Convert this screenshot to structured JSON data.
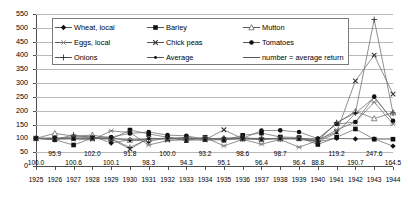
{
  "chart_data": {
    "type": "line",
    "title": "",
    "xlabel": "",
    "ylabel": "",
    "ylim": [
      0,
      550
    ],
    "ytick_step": 50,
    "grid": "horizontal",
    "legend_position": "top-inside",
    "categories": [
      "1925",
      "1926",
      "1927",
      "1928",
      "1929",
      "1930",
      "1931",
      "1932",
      "1933",
      "1934",
      "1935",
      "1936",
      "1937",
      "1938",
      "1939",
      "1940",
      "1941",
      "1942",
      "1943",
      "1944"
    ],
    "yticks": [
      "0",
      "50",
      "100",
      "150",
      "200",
      "250",
      "300",
      "350",
      "400",
      "450",
      "500",
      "550"
    ],
    "series": [
      {
        "name": "Wheat, local",
        "marker": "filled-diamond",
        "values": [
          100,
          100,
          105,
          108,
          83,
          95,
          89,
          103,
          99,
          97,
          101,
          103,
          97,
          101,
          99,
          88,
          100,
          98,
          98,
          72
        ]
      },
      {
        "name": "Barley",
        "marker": "filled-square",
        "values": [
          100,
          95,
          76,
          101,
          97,
          130,
          116,
          104,
          92,
          104,
          93,
          111,
          119,
          105,
          103,
          78,
          104,
          134,
          97,
          97
        ]
      },
      {
        "name": "Mutton",
        "marker": "open-triangle",
        "values": [
          100,
          118,
          108,
          112,
          101,
          94,
          97,
          98,
          101,
          99,
          100,
          100,
          100,
          99,
          100,
          97,
          155,
          198,
          172,
          193
        ]
      },
      {
        "name": "Eggs, local",
        "marker": "star",
        "values": [
          100,
          99,
          97,
          95,
          127,
          121,
          76,
          92,
          95,
          103,
          73,
          96,
          79,
          96,
          68,
          92,
          131,
          159,
          231,
          152
        ]
      },
      {
        "name": "Chick peas",
        "marker": "cross-x",
        "values": [
          100,
          98,
          101,
          99,
          98,
          61,
          101,
          97,
          103,
          95,
          131,
          99,
          95,
          101,
          99,
          95,
          123,
          308,
          401,
          260
        ]
      },
      {
        "name": "Tomatoes",
        "marker": "filled-circle",
        "values": [
          100,
          102,
          99,
          103,
          105,
          118,
          123,
          112,
          109,
          97,
          97,
          100,
          128,
          129,
          123,
          99,
          152,
          159,
          251,
          164
        ]
      },
      {
        "name": "Onions",
        "marker": "plus",
        "values": [
          100,
          96,
          112,
          102,
          99,
          67,
          99,
          100,
          102,
          98,
          98,
          98,
          100,
          98,
          101,
          90,
          157,
          192,
          530,
          192
        ]
      },
      {
        "name": "Average",
        "marker": "small-dot",
        "values": [
          100,
          95.9,
          100.6,
          102,
          100.1,
          91.8,
          98.3,
          100,
          94.3,
          93.2,
          95.1,
          98.6,
          96.4,
          98.7,
          96.4,
          88.8,
          119.2,
          190.7,
          247.6,
          164.5
        ]
      }
    ],
    "data_labels": {
      "description": "number = average return",
      "row_upper": [
        {
          "year": "1926",
          "value": "95.9"
        },
        {
          "year": "1928",
          "value": "102.0"
        },
        {
          "year": "1930",
          "value": "91.8"
        },
        {
          "year": "1932",
          "value": "100.0"
        },
        {
          "year": "1934",
          "value": "93.2"
        },
        {
          "year": "1936",
          "value": "98.6"
        },
        {
          "year": "1938",
          "value": "98.7"
        },
        {
          "year": "1941",
          "value": "119.2"
        },
        {
          "year": "1943",
          "value": "247.6"
        }
      ],
      "row_lower": [
        {
          "year": "1925",
          "value": "100.0"
        },
        {
          "year": "1927",
          "value": "100.6"
        },
        {
          "year": "1929",
          "value": "100.1"
        },
        {
          "year": "1931",
          "value": "98.3"
        },
        {
          "year": "1933",
          "value": "94.3"
        },
        {
          "year": "1935",
          "value": "95.1"
        },
        {
          "year": "1937",
          "value": "96.4"
        },
        {
          "year": "1939",
          "value": "96.4"
        },
        {
          "year": "1940",
          "value": "88.8"
        },
        {
          "year": "1942",
          "value": "190.7"
        },
        {
          "year": "1944",
          "value": "164.5"
        }
      ]
    }
  },
  "legend": {
    "items": [
      {
        "label": "Wheat, local",
        "marker": "filled-diamond"
      },
      {
        "label": "Barley",
        "marker": "filled-square"
      },
      {
        "label": "Mutton",
        "marker": "open-triangle"
      },
      {
        "label": "Eggs, local",
        "marker": "star"
      },
      {
        "label": "Chick peas",
        "marker": "cross-x"
      },
      {
        "label": "Tomatoes",
        "marker": "filled-circle"
      },
      {
        "label": "Onions",
        "marker": "plus"
      },
      {
        "label": "Average",
        "marker": "small-dot"
      },
      {
        "label": "number = average return",
        "marker": "line-only"
      }
    ]
  }
}
